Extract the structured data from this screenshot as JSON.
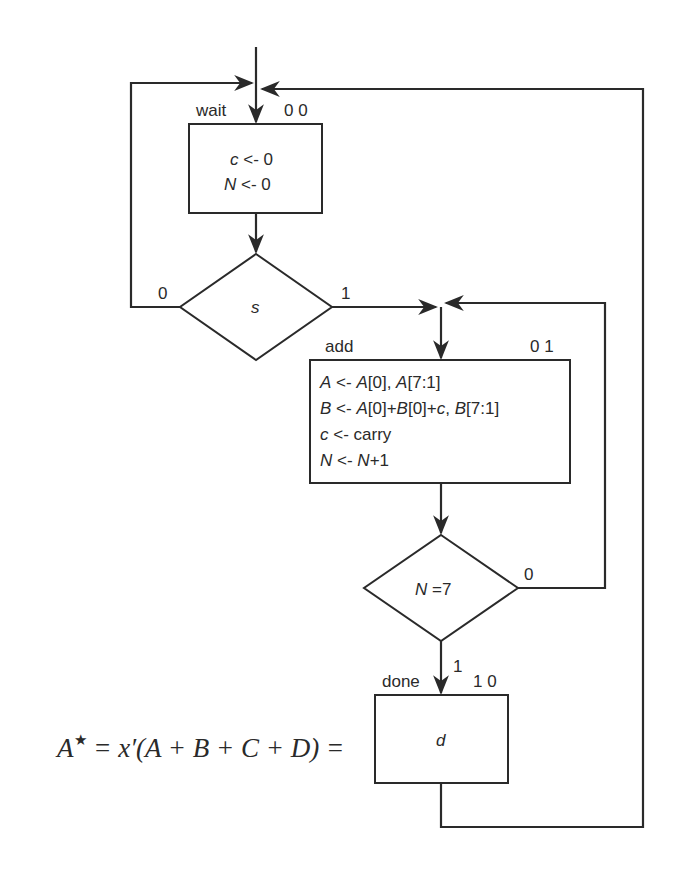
{
  "diagram": {
    "type": "ASM chart (algorithmic state machine)",
    "states": [
      {
        "name": "wait",
        "code": "0 0",
        "actions": [
          {
            "lhs": "c",
            "op": "<-",
            "rhs": "0"
          },
          {
            "lhs": "N",
            "op": "<-",
            "rhs": "0"
          }
        ]
      },
      {
        "name": "add",
        "code": "0 1",
        "actions": [
          {
            "lhs": "A",
            "op": "<-",
            "rhs_parts": [
              "A",
              "[0], ",
              "A",
              "[7:1]"
            ]
          },
          {
            "lhs": "B",
            "op": "<-",
            "rhs_parts": [
              "A",
              "[0]+",
              "B",
              "[0]+",
              "c",
              ", ",
              "B",
              "[7:1]"
            ]
          },
          {
            "lhs": "c",
            "op": "<-",
            "rhs": "carry"
          },
          {
            "lhs": "N",
            "op": "<-",
            "rhs_parts": [
              "N",
              "+1"
            ]
          }
        ]
      },
      {
        "name": "done",
        "code": "1 0",
        "actions": [
          {
            "text": "d"
          }
        ]
      }
    ],
    "decisions": [
      {
        "condition": "s",
        "false_label": "0",
        "true_label": "1"
      },
      {
        "condition_var": "N",
        "condition_rest": " =7",
        "false_label": "0",
        "true_label": "1"
      }
    ]
  },
  "overlay_formula": {
    "lhs": "A",
    "sup": "★",
    "text": " = x′(A + B + C + D) = "
  }
}
